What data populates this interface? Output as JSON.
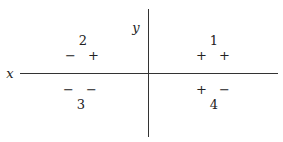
{
  "axes": {
    "x_label": "x",
    "y_label": "y"
  },
  "quadrants": [
    {
      "number": "1",
      "signs": "+ +"
    },
    {
      "number": "2",
      "signs": "− +"
    },
    {
      "number": "3",
      "signs": "− −"
    },
    {
      "number": "4",
      "signs": "+ −"
    }
  ]
}
